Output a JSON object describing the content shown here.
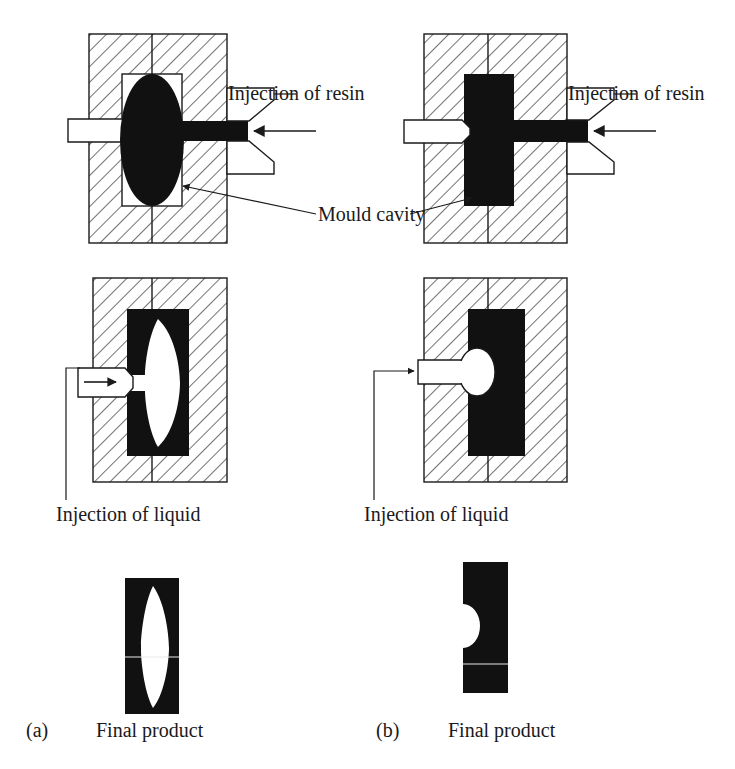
{
  "figure": {
    "colors": {
      "line": "#1a1a1a",
      "hatch": "#4d4d4d",
      "fill_solid": "#111111",
      "background": "#ffffff",
      "cavity_white": "#ffffff"
    },
    "panels": [
      {
        "id": "a",
        "letter": "(a)",
        "rows": [
          {
            "step": 1,
            "name": "resin-injection-step",
            "labels": [
              "Injection of resin",
              "Mould cavity"
            ],
            "cavity_shape": "ellipse",
            "resin_state": "filled-black"
          },
          {
            "step": 2,
            "name": "liquid-injection-step",
            "labels": [
              "Injection of liquid"
            ],
            "cavity_shape": "lens-biconvex-white",
            "resin_state": "black-shell-white-core"
          },
          {
            "step": 3,
            "name": "final-product-step",
            "labels": [
              "Final product"
            ],
            "product_shape": "block-with-lens-void"
          }
        ]
      },
      {
        "id": "b",
        "letter": "(b)",
        "rows": [
          {
            "step": 1,
            "name": "resin-injection-step",
            "labels": [
              "Injection of resin"
            ],
            "cavity_shape": "rectangle",
            "resin_state": "filled-black"
          },
          {
            "step": 2,
            "name": "liquid-injection-step",
            "labels": [
              "Injection of liquid"
            ],
            "cavity_shape": "small-round-white-bubble",
            "resin_state": "black-block-white-bubble"
          },
          {
            "step": 3,
            "name": "final-product-step",
            "labels": [
              "Final product"
            ],
            "product_shape": "block-with-semicircular-notch"
          }
        ]
      }
    ],
    "text": {
      "injection_of_resin_left": "Injection of resin",
      "injection_of_resin_right": "Injection of resin",
      "mould_cavity": "Mould cavity",
      "injection_of_liquid_left": "Injection of liquid",
      "injection_of_liquid_right": "Injection of liquid",
      "final_product_left": "Final product",
      "final_product_right": "Final product",
      "panel_a_letter": "(a)",
      "panel_b_letter": "(b)"
    }
  }
}
